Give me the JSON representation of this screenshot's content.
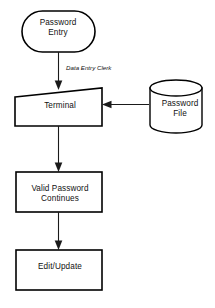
{
  "diagram": {
    "type": "flowchart",
    "stroke_color": "#000000",
    "fill_color": "#ffffff",
    "text_color": "#111111",
    "nodes": [
      {
        "id": "password-entry",
        "label": "Password\nEntry",
        "shape": "stadium"
      },
      {
        "id": "terminal",
        "label": "Terminal",
        "shape": "manual-input"
      },
      {
        "id": "password-file",
        "label": "Password\nFile",
        "shape": "cylinder"
      },
      {
        "id": "valid-password",
        "label": "Valid Password\nContinues",
        "shape": "rectangle"
      },
      {
        "id": "edit-update",
        "label": "Edit/Update",
        "shape": "rectangle"
      }
    ],
    "edges": [
      {
        "id": "password-entry-to-terminal",
        "from": "password-entry",
        "to": "terminal",
        "label": "Data Entry Clerk",
        "direction": "down"
      },
      {
        "id": "password-file-to-terminal",
        "from": "password-file",
        "to": "terminal",
        "label": "",
        "direction": "left"
      },
      {
        "id": "terminal-to-valid-password",
        "from": "terminal",
        "to": "valid-password",
        "label": "",
        "direction": "down"
      },
      {
        "id": "valid-password-to-edit-update",
        "from": "valid-password",
        "to": "edit-update",
        "label": "",
        "direction": "down"
      }
    ]
  }
}
